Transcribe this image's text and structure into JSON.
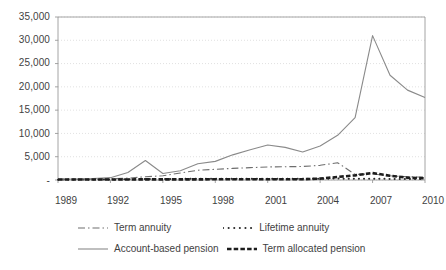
{
  "chart_data": {
    "type": "line",
    "title": "",
    "subtitle": "",
    "xlabel": "",
    "ylabel": "",
    "xlim": [
      1989,
      2010
    ],
    "ylim": [
      0,
      35000
    ],
    "grid": true,
    "legend_position": "bottom",
    "x": [
      1989,
      1990,
      1991,
      1992,
      1993,
      1994,
      1995,
      1996,
      1997,
      1998,
      1999,
      2000,
      2001,
      2002,
      2003,
      2004,
      2005,
      2006,
      2007,
      2008,
      2009,
      2010
    ],
    "y_ticks": [
      0,
      5000,
      10000,
      15000,
      20000,
      25000,
      30000,
      35000
    ],
    "y_tick_labels": [
      "-",
      "5,000",
      "10,000",
      "15,000",
      "20,000",
      "25,000",
      "30,000",
      "35,000"
    ],
    "x_tick_values": [
      1989,
      1992,
      1995,
      1998,
      2001,
      2004,
      2007,
      2010
    ],
    "x_tick_labels": [
      "1989",
      "1992",
      "1995",
      "1998",
      "2001",
      "2004",
      "2007",
      "2010"
    ],
    "series": [
      {
        "name": "Term annuity",
        "style": "dash-dot",
        "color": "#6e6e6e",
        "values": [
          120,
          150,
          180,
          250,
          400,
          700,
          900,
          1500,
          2100,
          2300,
          2500,
          2650,
          2800,
          2850,
          2900,
          3150,
          3700,
          1200,
          1300,
          900,
          700,
          600
        ]
      },
      {
        "name": "Lifetime annuity",
        "style": "dotted",
        "color": "#2b2b2b",
        "values": [
          80,
          90,
          100,
          120,
          150,
          200,
          220,
          240,
          260,
          260,
          270,
          270,
          280,
          280,
          280,
          290,
          300,
          280,
          260,
          240,
          220,
          200
        ]
      },
      {
        "name": "Account-based pension",
        "style": "solid",
        "color": "#8a8a8a",
        "values": [
          150,
          200,
          300,
          500,
          1600,
          4200,
          1400,
          2000,
          3500,
          4000,
          5400,
          6500,
          7500,
          7000,
          6000,
          7300,
          9600,
          13400,
          31000,
          22500,
          19300,
          17700
        ]
      },
      {
        "name": "Term allocated pension",
        "style": "thick-dashed",
        "color": "#1d1d1d",
        "values": [
          100,
          100,
          110,
          110,
          120,
          130,
          130,
          140,
          140,
          150,
          150,
          150,
          160,
          160,
          170,
          300,
          650,
          1000,
          1500,
          900,
          500,
          350
        ]
      }
    ]
  },
  "axis": {
    "y_labels": [
      "35,000",
      "30,000",
      "25,000",
      "20,000",
      "15,000",
      "10,000",
      "5,000",
      "-"
    ],
    "x_labels": [
      "1989",
      "1992",
      "1995",
      "1998",
      "2001",
      "2004",
      "2007",
      "2010"
    ]
  },
  "legend": {
    "items": [
      {
        "label": "Term annuity",
        "style": "dash-dot"
      },
      {
        "label": "Lifetime annuity",
        "style": "dotted"
      },
      {
        "label": "Account-based pension",
        "style": "solid"
      },
      {
        "label": "Term allocated pension",
        "style": "thick-dashed"
      }
    ]
  },
  "colors": {
    "grid": "#d9d9d9",
    "axis": "#9a9a9a",
    "text": "#3f3f3f",
    "series_term_annuity": "#6e6e6e",
    "series_lifetime_annuity": "#2b2b2b",
    "series_account_based": "#8a8a8a",
    "series_term_allocated": "#1d1d1d"
  }
}
